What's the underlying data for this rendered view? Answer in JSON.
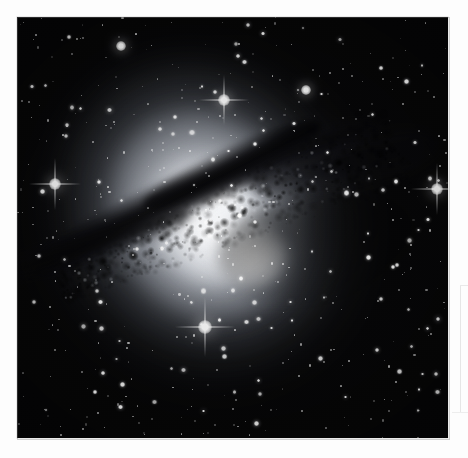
{
  "page": {
    "background_color": "#fdfdfd",
    "width": 468,
    "height": 458,
    "visible_text": ""
  },
  "plate": {
    "name": "astronomical-photographic-plate",
    "left": 17,
    "top": 17,
    "width": 431,
    "height": 421,
    "background_color": "#050506",
    "border_color": "#787878"
  },
  "chart_data": {
    "type": "scatter",
    "title": "",
    "subtitle": "",
    "xlabel": "",
    "ylabel": "",
    "grid": false,
    "legend": null,
    "image_field": {
      "colorspace": "grayscale",
      "sky_background_level": 5,
      "peak_brightness_level": 255
    },
    "galaxy": {
      "name": "elliptical-galaxy",
      "center_x": 236,
      "center_y": 231,
      "halo_semimajor_px": 176,
      "halo_semiminor_px": 146,
      "position_angle_deg": -30,
      "nucleus_upper": {
        "x": 200,
        "y": 178,
        "peak": 252
      },
      "nucleus_lower": {
        "x": 233,
        "y": 238,
        "peak": 255
      }
    },
    "dust_lane": {
      "name": "dark-dust-lane",
      "angle_deg": -27,
      "start": {
        "x": 60,
        "y": 290
      },
      "end": {
        "x": 400,
        "y": 140
      },
      "thickness_px": 34,
      "opacity": 0.95
    },
    "bright_stars": [
      {
        "id": "star-foreground-south",
        "x": 205,
        "y": 327,
        "magnitude": 1.0,
        "spikes": true
      },
      {
        "id": "star-west-edge",
        "x": 55,
        "y": 184,
        "magnitude": 0.8,
        "spikes": true
      },
      {
        "id": "star-east-edge",
        "x": 437,
        "y": 189,
        "magnitude": 0.8,
        "spikes": true
      },
      {
        "id": "star-north-halo",
        "x": 224,
        "y": 100,
        "magnitude": 0.7,
        "spikes": true
      },
      {
        "id": "star-northwest",
        "x": 121,
        "y": 46,
        "magnitude": 0.5,
        "spikes": false
      },
      {
        "id": "star-northeast",
        "x": 306,
        "y": 90,
        "magnitude": 0.5,
        "spikes": false
      }
    ],
    "star_counts": {
      "bright": 6,
      "medium": 120,
      "faint": 430
    }
  },
  "artifacts": {
    "scan_rule_vertical": {
      "x": 460,
      "y": 285,
      "length": 128,
      "color": "#e6e6e6"
    },
    "scan_rule_horizontal": {
      "x": 452,
      "y": 412,
      "length": 16,
      "color": "#ededed"
    }
  }
}
